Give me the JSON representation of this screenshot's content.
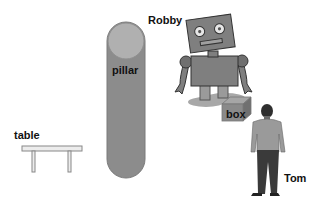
{
  "scene": {
    "labels": {
      "robby": "Robby",
      "pillar": "pillar",
      "box": "box",
      "table": "table",
      "tom": "Tom"
    },
    "colors": {
      "pillar_body": "#8c8c8c",
      "pillar_top": "#b0b0b0",
      "robot_body": "#7f7f7f",
      "robot_shadow": "#a8a8a8",
      "box_front": "#8a8a8a",
      "box_top": "#a6a6a6",
      "table": "#e6e6e6",
      "person_shirt": "#9a9a9a",
      "person_pants": "#3a3a3a"
    }
  }
}
